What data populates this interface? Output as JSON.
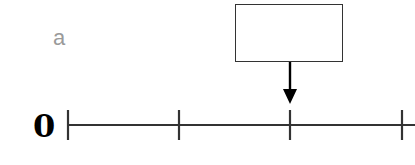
{
  "diagram": {
    "type": "number-line",
    "label_a": "a",
    "origin_label": "0",
    "answer_box": {
      "value": "",
      "empty": true
    },
    "number_line": {
      "tick_count": 4,
      "tick_x": [
        68,
        179,
        290,
        402
      ],
      "arrow_points_to_tick_index": 2,
      "line_color": "#333333"
    },
    "colors": {
      "label_a": "#9a9a9a",
      "origin_label": "#000000",
      "line": "#333333",
      "arrow": "#000000"
    }
  }
}
